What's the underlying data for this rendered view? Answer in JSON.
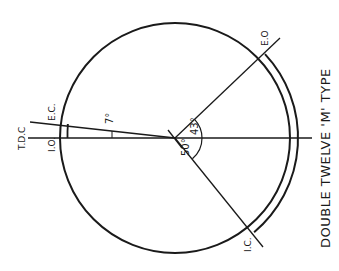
{
  "diagram": {
    "caption": "DOUBLE TWELVE 'M' TYPE",
    "labels": {
      "tdc": "T.D.C",
      "ec": "E.C.",
      "io": "I.O.",
      "eo": "E.O",
      "ic": "I.C."
    },
    "angles": {
      "ec_before_tdc": "7°",
      "eo_before_bdc": "43°",
      "ic_after_bdc": "50°"
    },
    "colors": {
      "stroke": "#1a1a1a",
      "background": "#ffffff"
    }
  }
}
